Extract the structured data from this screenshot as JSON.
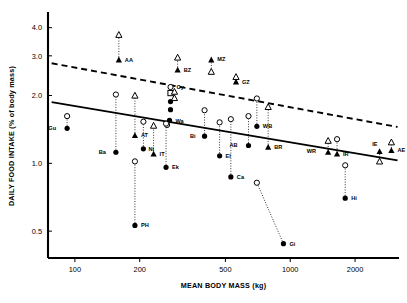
{
  "chart_data": {
    "type": "scatter",
    "title": "",
    "xlabel": "MEAN BODY MASS (kg)",
    "ylabel": "DAILY FOOD INTAKE (% of body mass)",
    "xscale": "log",
    "yscale": "log",
    "xlim": [
      75,
      3200
    ],
    "ylim": [
      0.38,
      4.6
    ],
    "xticks": [
      100,
      200,
      500,
      1000,
      2000
    ],
    "xtick_labels": [
      "100",
      "200",
      "500",
      "1000",
      "2000"
    ],
    "yticks": [
      0.5,
      1.0,
      2.0,
      3.0,
      4.0
    ],
    "ytick_labels": [
      "0.5",
      "1.0",
      "2.0",
      "3.0",
      "4.0"
    ],
    "grid": false,
    "legend": null,
    "marker_types": {
      "filled_circle": "filled circle",
      "open_circle": "open circle",
      "filled_triangle": "filled triangle",
      "open_triangle": "open triangle",
      "open_square": "open square"
    },
    "lines": [
      {
        "name": "solid regression line",
        "style": "solid",
        "x": [
          78,
          3150
        ],
        "y": [
          1.87,
          1.03
        ]
      },
      {
        "name": "dashed regression line",
        "style": "dashed",
        "x": [
          78,
          3150
        ],
        "y": [
          2.78,
          1.45
        ]
      }
    ],
    "connectors": [
      {
        "from": "AA_open_triangle",
        "to": "AA_filled_triangle"
      },
      {
        "from": "BZ_open_triangle",
        "to": "BZ_filled_triangle"
      },
      {
        "from": "MZ_open_triangle",
        "to": "MZ_filled_triangle"
      },
      {
        "from": "GZ_open_triangle",
        "to": "GZ_filled_triangle"
      },
      {
        "from": "Gu_open_circle",
        "to": "Gu_filled_circle"
      },
      {
        "from": "Ba_open_circle",
        "to": "Ba_filled_circle"
      },
      {
        "from": "AT_open_triangle",
        "to": "AT_filled_triangle"
      },
      {
        "from": "Ni_open_circle",
        "to": "Ni_filled_circle"
      },
      {
        "from": "PH_open_circle",
        "to": "PH_filled_circle"
      },
      {
        "from": "IT_open_triangle",
        "to": "IT_filled_triangle"
      },
      {
        "from": "Oy_open_circle",
        "to": "Oy_filled_circle"
      },
      {
        "from": "Wa_open_circle",
        "to": "Wa_filled_circle"
      },
      {
        "from": "Ek_open_circle",
        "to": "Ek_filled_circle"
      },
      {
        "from": "Bi_open_circle",
        "to": "Bi_filled_circle"
      },
      {
        "from": "El_open_circle",
        "to": "El_filled_circle"
      },
      {
        "from": "Ca_open_circle",
        "to": "Ca_filled_circle"
      },
      {
        "from": "Gi_open_circle",
        "to": "Gi_filled_circle"
      },
      {
        "from": "AB_open_circle",
        "to": "AB_filled_circle"
      },
      {
        "from": "WB_open_circle",
        "to": "WB_filled_circle"
      },
      {
        "from": "BR_open_triangle",
        "to": "BR_filled_triangle"
      },
      {
        "from": "WR_open_triangle",
        "to": "WR_filled_triangle"
      },
      {
        "from": "IR_open_circle",
        "to": "IR_filled_triangle"
      },
      {
        "from": "Hi_open_circle",
        "to": "Hi_filled_circle"
      },
      {
        "from": "IE_open_triangle",
        "to": "IE_filled_triangle"
      },
      {
        "from": "AE_open_triangle",
        "to": "AE_filled_triangle"
      }
    ],
    "points": [
      {
        "label": "AA",
        "x": 160,
        "y": 2.88,
        "marker": "filled_triangle",
        "label_dx": 6,
        "label_dy": 2
      },
      {
        "label": "",
        "x": 160,
        "y": 3.72,
        "marker": "open_triangle"
      },
      {
        "label": "BZ",
        "x": 300,
        "y": 2.6,
        "marker": "filled_triangle",
        "label_dx": 6,
        "label_dy": 2
      },
      {
        "label": "",
        "x": 300,
        "y": 2.95,
        "marker": "open_triangle"
      },
      {
        "label": "MZ",
        "x": 430,
        "y": 2.88,
        "marker": "filled_triangle",
        "label_dx": 6,
        "label_dy": 1
      },
      {
        "label": "",
        "x": 430,
        "y": 2.55,
        "marker": "open_triangle"
      },
      {
        "label": "GZ",
        "x": 560,
        "y": 2.3,
        "marker": "filled_triangle",
        "label_dx": 6,
        "label_dy": 2
      },
      {
        "label": "",
        "x": 560,
        "y": 2.42,
        "marker": "open_triangle"
      },
      {
        "label": "Oy",
        "x": 278,
        "y": 2.18,
        "marker": "open_circle",
        "label_dx": 6,
        "label_dy": 2
      },
      {
        "label": "",
        "x": 278,
        "y": 2.05,
        "marker": "open_square"
      },
      {
        "label": "",
        "x": 278,
        "y": 1.88,
        "marker": "filled_circle"
      },
      {
        "label": "",
        "x": 278,
        "y": 1.73,
        "marker": "filled_circle"
      },
      {
        "label": "Wa",
        "x": 275,
        "y": 1.55,
        "marker": "filled_circle",
        "label_dx": 6,
        "label_dy": 3
      },
      {
        "label": "",
        "x": 268,
        "y": 1.48,
        "marker": "open_circle"
      },
      {
        "label": "",
        "x": 290,
        "y": 2.08,
        "marker": "open_triangle"
      },
      {
        "label": "",
        "x": 290,
        "y": 1.95,
        "marker": "open_triangle"
      },
      {
        "label": "Gu",
        "x": 92,
        "y": 1.43,
        "marker": "filled_circle",
        "label_dx": -11,
        "label_dy": 2
      },
      {
        "label": "",
        "x": 92,
        "y": 1.62,
        "marker": "open_circle"
      },
      {
        "label": "Ba",
        "x": 155,
        "y": 1.12,
        "marker": "filled_circle",
        "label_dx": -10,
        "label_dy": 2
      },
      {
        "label": "",
        "x": 155,
        "y": 2.02,
        "marker": "open_circle"
      },
      {
        "label": "AT",
        "x": 190,
        "y": 1.33,
        "marker": "filled_triangle",
        "label_dx": 6,
        "label_dy": 2
      },
      {
        "label": "",
        "x": 190,
        "y": 2.0,
        "marker": "open_triangle"
      },
      {
        "label": "Ni",
        "x": 208,
        "y": 1.16,
        "marker": "filled_circle",
        "label_dx": 5,
        "label_dy": 2
      },
      {
        "label": "",
        "x": 208,
        "y": 1.53,
        "marker": "open_circle"
      },
      {
        "label": "PH",
        "x": 190,
        "y": 0.53,
        "marker": "filled_circle",
        "label_dx": 6,
        "label_dy": 2
      },
      {
        "label": "",
        "x": 190,
        "y": 1.02,
        "marker": "open_circle"
      },
      {
        "label": "IT",
        "x": 232,
        "y": 1.1,
        "marker": "filled_triangle",
        "label_dx": 6,
        "label_dy": 2
      },
      {
        "label": "",
        "x": 232,
        "y": 1.47,
        "marker": "open_triangle"
      },
      {
        "label": "Ek",
        "x": 265,
        "y": 0.96,
        "marker": "filled_circle",
        "label_dx": 6,
        "label_dy": 2
      },
      {
        "label": "",
        "x": 265,
        "y": 1.5,
        "marker": "open_circle"
      },
      {
        "label": "Bi",
        "x": 400,
        "y": 1.32,
        "marker": "filled_circle",
        "label_dx": -9,
        "label_dy": 2
      },
      {
        "label": "",
        "x": 400,
        "y": 1.72,
        "marker": "open_circle"
      },
      {
        "label": "El",
        "x": 470,
        "y": 1.08,
        "marker": "filled_circle",
        "label_dx": 6,
        "label_dy": 2
      },
      {
        "label": "",
        "x": 470,
        "y": 1.52,
        "marker": "open_circle"
      },
      {
        "label": "Ca",
        "x": 530,
        "y": 0.87,
        "marker": "filled_circle",
        "label_dx": 6,
        "label_dy": 2
      },
      {
        "label": "",
        "x": 530,
        "y": 1.57,
        "marker": "open_circle"
      },
      {
        "label": "Gi",
        "x": 930,
        "y": 0.44,
        "marker": "filled_circle",
        "label_dx": 6,
        "label_dy": 2
      },
      {
        "label": "",
        "x": 700,
        "y": 0.82,
        "marker": "open_circle"
      },
      {
        "label": "AB",
        "x": 640,
        "y": 1.2,
        "marker": "filled_circle",
        "label_dx": -11,
        "label_dy": 2
      },
      {
        "label": "",
        "x": 640,
        "y": 1.62,
        "marker": "open_circle"
      },
      {
        "label": "WB",
        "x": 700,
        "y": 1.46,
        "marker": "filled_circle",
        "label_dx": 6,
        "label_dy": 2
      },
      {
        "label": "",
        "x": 700,
        "y": 1.94,
        "marker": "open_circle"
      },
      {
        "label": "BR",
        "x": 790,
        "y": 1.18,
        "marker": "filled_triangle",
        "label_dx": 6,
        "label_dy": 2
      },
      {
        "label": "",
        "x": 790,
        "y": 1.78,
        "marker": "open_triangle"
      },
      {
        "label": "WR",
        "x": 1500,
        "y": 1.12,
        "marker": "filled_triangle",
        "label_dx": -12,
        "label_dy": 1
      },
      {
        "label": "",
        "x": 1500,
        "y": 1.26,
        "marker": "open_triangle"
      },
      {
        "label": "IR",
        "x": 1650,
        "y": 1.1,
        "marker": "filled_triangle",
        "label_dx": 6,
        "label_dy": 2
      },
      {
        "label": "",
        "x": 1650,
        "y": 1.28,
        "marker": "open_circle"
      },
      {
        "label": "Hi",
        "x": 1800,
        "y": 0.7,
        "marker": "filled_circle",
        "label_dx": 6,
        "label_dy": 2
      },
      {
        "label": "",
        "x": 1800,
        "y": 0.98,
        "marker": "open_circle"
      },
      {
        "label": "IE",
        "x": 2600,
        "y": 1.13,
        "marker": "filled_triangle",
        "label_dx": -2,
        "label_dy": -5
      },
      {
        "label": "",
        "x": 2600,
        "y": 1.02,
        "marker": "open_triangle"
      },
      {
        "label": "AE",
        "x": 2950,
        "y": 1.14,
        "marker": "filled_triangle",
        "label_dx": 6,
        "label_dy": 1
      },
      {
        "label": "",
        "x": 2950,
        "y": 1.24,
        "marker": "open_triangle"
      }
    ]
  }
}
